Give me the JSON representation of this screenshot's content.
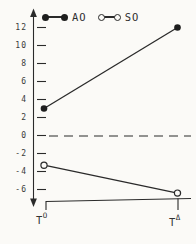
{
  "figure": {
    "kind": "scanned-interaction-plot",
    "background": "#fbfaf7",
    "ink_color": "#2a2a2a"
  },
  "legend": {
    "items": [
      {
        "label": "AO",
        "marker": "filled-dot-line"
      },
      {
        "label": "SO",
        "marker": "open-dot-line"
      }
    ]
  },
  "chart_data": {
    "type": "line",
    "title": "",
    "xlabel": "",
    "ylabel": "",
    "categories": [
      {
        "base": "T",
        "sup": "O"
      },
      {
        "base": "T",
        "sup": "Δ"
      }
    ],
    "series": [
      {
        "name": "AO",
        "marker": "filled",
        "values": [
          3,
          12
        ]
      },
      {
        "name": "SO",
        "marker": "open",
        "values": [
          -3.3,
          -6.4
        ]
      }
    ],
    "yticks": [
      12,
      10,
      8,
      6,
      4,
      2,
      0,
      -2,
      -4,
      -6
    ],
    "ylim": [
      -7.5,
      13.5
    ],
    "zero_line": {
      "value": 0,
      "style": "dashed"
    },
    "grid": false,
    "legend_position": "top-inside",
    "axis_arrows": "both-ends-vertical"
  }
}
